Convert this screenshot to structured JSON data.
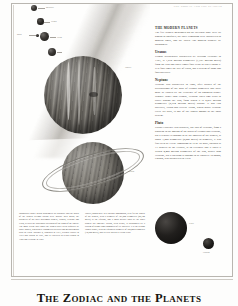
{
  "page": {
    "running_head": "The Zodiac and the Planets",
    "chapter_title": "The Zodiac and the Planets"
  },
  "right_column": {
    "sections": [
      {
        "heading": "The Modern Planets",
        "body": "The five planets mentioned on the previous page were all known to antiquity; the three remaining were discovered in modern times, and are called \"the modern planets\" by astrologers."
      },
      {
        "heading": "Uranus",
        "body": "Uranus accidentally discovered by William Herschel in 1781, is 1,870 million kilometres (1,783 million miles) from the Sun and takes eighty-four years to travel round it. It is four times the size of Earth, has a system of rings and four satellites."
      },
      {
        "heading": "Neptune",
        "body": "Neptune was discovered in 1846, after studies of the perturbations of the orbit of Uranus suggested that there must be caused by the existence of an unknown planet. Slightly larger than Uranus, Neptune takes 248 years to travel around the Sun, from which it is 4,497 million kilometres (2,794 million miles) distant. It has two satellites, Triton and Nereid. Triton, which orbits Neptune every six days, is one of the largest moons in the solar system."
      },
      {
        "heading": "Pluto",
        "body": "Pluto's existence was deduced, like that of Neptune, from a problem in the motion of the orbits of Uranus and Neptune, but a century is thought to be the smallest of the planets, at about 3,000 kilometres (2,000 miles) in diameter, it was first seen by Clyde Tombaugh in 1930. Its orbit, inclined at 17 degrees to the ecliptic, is so eccentric that it takes it within 4,400 million kilometres of the Sun, nearer than Neptune, but a collision is thought to be unlikely. Its moon, Charon, was discovered in 1978."
      }
    ]
  },
  "captions": {
    "left": "Boundaries above Much astrologers are ordinary and the orbits of the planets beyond Saturn were outside their grasp; the discovery of the three outermost planets, Uranus, Neptune and Pluto, revised the traditional rulerships of the signs of the zodiac. The most recent data about the planets have been acquired by space probes, which have transmitted pictures and measurements back to Earth. Voyager 2, launched in 1977, reached Jupiter in 1979 and Saturn in 1981, and is expected to reach Uranus in 1986 and Neptune in 1989.",
    "right": "Jupiter, shown here in a Voyager photograph, is by far the largest of the planets, with a diameter of 143,000 kilometres (88,700 miles) at the equator, and a mass greater than all the other planets put together. Saturn, seen below, is surrounded by a system of bright rings composed of ice particles. It is the second largest planet, with an equatorial diameter of 120,000 kilometres (74,600 miles), and its year lasts 29.5 Earth years."
  },
  "figure_labels": [
    {
      "name": "Mercury"
    },
    {
      "name": "Venus"
    },
    {
      "name": "Earth"
    },
    {
      "name": "Mars"
    },
    {
      "name": "Jupiter"
    },
    {
      "name": "Saturn"
    },
    {
      "name": "Pluto"
    },
    {
      "name": "Charon"
    }
  ]
}
